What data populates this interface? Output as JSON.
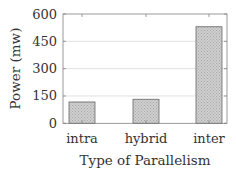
{
  "chart_data": {
    "type": "bar",
    "title": "",
    "xlabel": "Type of Parallelism",
    "ylabel": "Power (mw)",
    "categories": [
      "intra",
      "hybrid",
      "inter"
    ],
    "values": [
      117,
      132,
      530
    ],
    "ylim": [
      0,
      600
    ],
    "yticks": [
      "0",
      "150",
      "300",
      "450",
      "600"
    ],
    "grid": true,
    "legend": null,
    "colors": {
      "bar_fill": "#c4c4c4",
      "bar_stroke": "#666666",
      "grid": "#d9d9d9",
      "axis": "#808080"
    }
  }
}
